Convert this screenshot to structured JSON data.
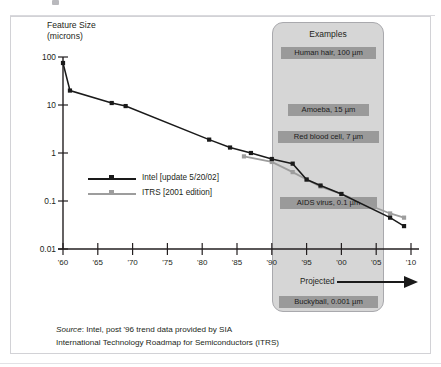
{
  "chart_data": {
    "type": "line",
    "title": "",
    "ylabel": "Feature Size (microns)",
    "ylabel_line1": "Feature Size",
    "ylabel_line2": "(microns)",
    "xlabel": "",
    "scale": "log-y",
    "ylim": [
      0.01,
      100
    ],
    "xlim": [
      1959,
      2010
    ],
    "grid": false,
    "legend_position": "center-left",
    "yticks": [
      "100",
      "10",
      "1",
      "0.1",
      "0.01"
    ],
    "ytick_values": [
      100,
      10,
      1,
      0.1,
      0.01
    ],
    "xticks": [
      "'60",
      "'65",
      "'70",
      "'75",
      "'80",
      "'85",
      "'90",
      "'95",
      "'00",
      "'05",
      "'10"
    ],
    "xtick_values": [
      1960,
      1965,
      1970,
      1975,
      1980,
      1985,
      1990,
      1995,
      2000,
      2005,
      2010
    ],
    "series": [
      {
        "name": "Intel [update 5/20/02]",
        "color": "#1a1a1a",
        "x": [
          1960,
          1961,
          1967,
          1969,
          1981,
          1984,
          1987,
          1990,
          1993,
          1995,
          1997,
          2000,
          2007,
          2009
        ],
        "values": [
          75,
          20,
          11,
          9.5,
          1.9,
          1.3,
          1.0,
          0.75,
          0.6,
          0.28,
          0.21,
          0.14,
          0.045,
          0.03
        ]
      },
      {
        "name": "ITRS [2001 edition]",
        "color": "#9d9d9d",
        "x": [
          1986,
          1990,
          1993,
          1995,
          1997,
          2000,
          2007,
          2009
        ],
        "values": [
          0.85,
          0.65,
          0.4,
          0.28,
          0.2,
          0.14,
          0.055,
          0.045
        ]
      }
    ],
    "annotations": [
      {
        "name": "examples-title",
        "text": "Examples"
      },
      {
        "name": "human-hair",
        "text": "Human hair, 100 µm",
        "value": 100
      },
      {
        "name": "amoeba",
        "text": "Amoeba, 15 µm",
        "value": 15
      },
      {
        "name": "red-blood-cell",
        "text": "Red blood cell, 7 µm",
        "value": 7
      },
      {
        "name": "aids-virus",
        "text": "AIDS virus, 0.1 µm",
        "value": 0.1
      },
      {
        "name": "buckyball",
        "text": "Buckyball, 0.001 µm",
        "value": 0.001
      },
      {
        "name": "projected",
        "text": "Projected"
      }
    ]
  },
  "axis": {
    "title_line1": "Feature Size",
    "title_line2": "(microns)"
  },
  "legend": {
    "items": [
      {
        "label": "Intel [update 5/20/02]",
        "color": "#1a1a1a"
      },
      {
        "label": "ITRS [2001 edition]",
        "color": "#9d9d9d"
      }
    ]
  },
  "examples": {
    "title": "Examples",
    "labels": [
      "Human hair, 100 µm",
      "Amoeba, 15 µm",
      "Red blood cell, 7 µm",
      "AIDS virus, 0.1 µm",
      "Buckyball, 0.001 µm"
    ]
  },
  "projected_label": "Projected",
  "source": {
    "prefix": "Source",
    "line1": ": Intel, post '96 trend data provided by SIA",
    "line2": "International Technology Roadmap for Semiconductors (ITRS)"
  },
  "colors": {
    "intel": "#1a1a1a",
    "itrs": "#9d9d9d",
    "box_fill": "#d6d6d6",
    "box_border": "#a9a9ad",
    "label_fill": "#9a9a9a",
    "frame_border": "#d2d2d6",
    "axis": "#231f20"
  }
}
